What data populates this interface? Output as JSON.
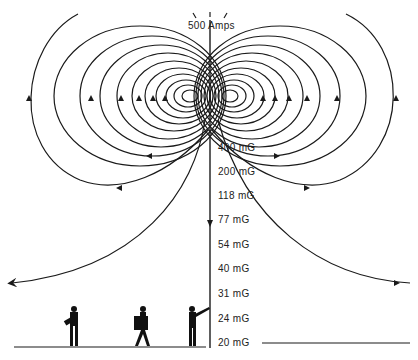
{
  "title": "500 Amps",
  "field_labels": [
    {
      "text": "400 mG",
      "y": 147
    },
    {
      "text": "200 mG",
      "y": 171
    },
    {
      "text": "118 mG",
      "y": 195
    },
    {
      "text": "77 mG",
      "y": 219
    },
    {
      "text": "54 mG",
      "y": 244
    },
    {
      "text": "40 mG",
      "y": 268
    },
    {
      "text": "31 mG",
      "y": 293
    },
    {
      "text": "24 mG",
      "y": 318
    },
    {
      "text": "20 mG",
      "y": 342
    }
  ],
  "figures": [
    "person-carrying-bag",
    "person-carrying-box",
    "person-pointing"
  ],
  "colors": {
    "line": "#1a1a1a",
    "background": "#ffffff"
  }
}
